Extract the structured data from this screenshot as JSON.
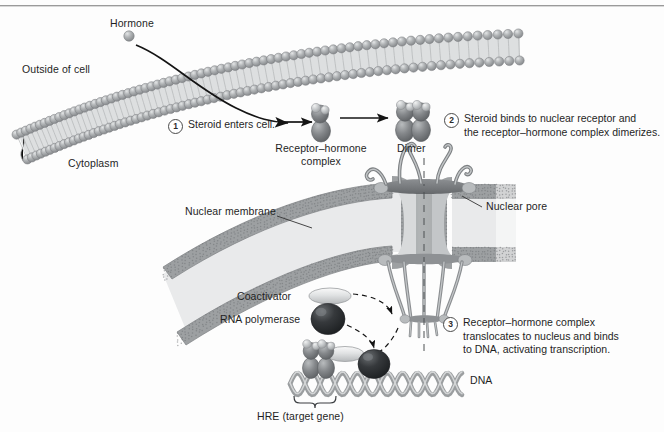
{
  "figure": {
    "background_color": "#fdfdfd",
    "ink_color": "#1f1f1f"
  },
  "labels": {
    "hormone": "Hormone",
    "outside_of_cell": "Outside of cell",
    "cytoplasm": "Cytoplasm",
    "receptor_hormone_complex": "Receptor–hormone\ncomplex",
    "receptor_hormone_complex_line1": "Receptor–hormone",
    "receptor_hormone_complex_line2": "complex",
    "dimer": "Dimer",
    "nuclear_membrane": "Nuclear membrane",
    "nuclear_pore": "Nuclear pore",
    "coactivator": "Coactivator",
    "rna_polymerase": "RNA polymerase",
    "dna": "DNA",
    "hre": "HRE (target gene)"
  },
  "steps": [
    {
      "number": "1",
      "text": "Steroid enters cell."
    },
    {
      "number": "2",
      "text": "Steroid binds to nuclear receptor and\nthe receptor–hormone complex dimerizes."
    },
    {
      "number": "3",
      "text": "Receptor–hormone complex\ntranslocates to nucleus and binds\nto DNA, activating transcription."
    }
  ],
  "colors": {
    "membrane_head": "#a9acae",
    "membrane_head_dark": "#8d9093",
    "membrane_tail": "#c9cbcc",
    "membrane_fill": "#d6d8d9",
    "nuclear_membrane_band": "#9c9ea0",
    "nuclear_lumen": "#e3e4e5",
    "pore_body": "#8e9093",
    "pore_light": "#cfd1d2",
    "receptor_dark": "#6e7174",
    "receptor_light": "#b9bcbe",
    "rna_pol": "#2e3133",
    "coactivator": "#dcdedf",
    "dna_strand": "#9b9ea0",
    "arrow": "#141414",
    "rule": "#9a9a9a"
  }
}
